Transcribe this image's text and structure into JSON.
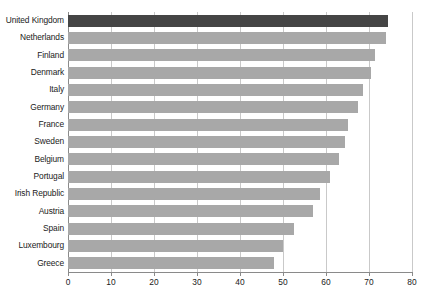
{
  "chart_data": {
    "type": "bar",
    "orientation": "horizontal",
    "title": "",
    "xlabel": "",
    "ylabel": "",
    "xlim": [
      0,
      80
    ],
    "xticks": [
      0,
      10,
      20,
      30,
      40,
      50,
      60,
      70,
      80
    ],
    "xtick_labels": [
      "0",
      "10",
      "20",
      "30",
      "40",
      "50",
      "60",
      "70",
      "80"
    ],
    "grid": true,
    "grid_axis": "x",
    "legend": "none",
    "categories": [
      "United Kingdom",
      "Netherlands",
      "Finland",
      "Denmark",
      "Italy",
      "Germany",
      "France",
      "Sweden",
      "Belgium",
      "Portugal",
      "Irish Republic",
      "Austria",
      "Spain",
      "Luxembourg",
      "Greece"
    ],
    "values": [
      74.5,
      74.0,
      71.5,
      70.5,
      68.5,
      67.5,
      65.0,
      64.5,
      63.0,
      61.0,
      58.5,
      57.0,
      52.5,
      50.0,
      48.0
    ],
    "series": [
      {
        "name": "",
        "values": [
          74.5,
          74.0,
          71.5,
          70.5,
          68.5,
          67.5,
          65.0,
          64.5,
          63.0,
          61.0,
          58.5,
          57.0,
          52.5,
          50.0,
          48.0
        ]
      }
    ],
    "highlight_index": 0,
    "colors": {
      "bar": "#a8a8a8",
      "bar_highlight": "#454545",
      "gridline": "#c9c9c9",
      "axis": "#8a8a8a",
      "text": "#1a1a1a",
      "background": "#ffffff"
    }
  }
}
